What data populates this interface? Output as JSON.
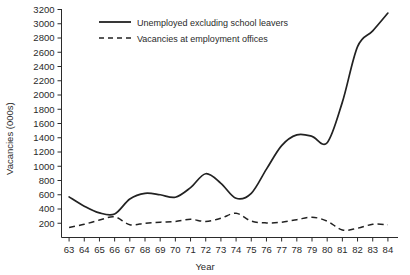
{
  "chart_data": {
    "type": "line",
    "title": "",
    "xlabel": "Year",
    "ylabel": "Vacancies (000s)",
    "xlim": [
      62.5,
      84.5
    ],
    "ylim": [
      0,
      3200
    ],
    "grid": false,
    "legend_position": "top-left",
    "x_tick_labels": [
      "63",
      "64",
      "65",
      "66",
      "67",
      "68",
      "69",
      "70",
      "71",
      "72",
      "73",
      "74",
      "75",
      "76",
      "77",
      "78",
      "79",
      "80",
      "81",
      "82",
      "83",
      "84"
    ],
    "y_tick_labels": [
      "200",
      "400",
      "600",
      "800",
      "1000",
      "1200",
      "1400",
      "1600",
      "1800",
      "2000",
      "2200",
      "2400",
      "2600",
      "2800",
      "3000",
      "3200"
    ],
    "y_ticks": [
      200,
      400,
      600,
      800,
      1000,
      1200,
      1400,
      1600,
      1800,
      2000,
      2200,
      2400,
      2600,
      2800,
      3000,
      3200
    ],
    "x": [
      63,
      64,
      65,
      66,
      67,
      68,
      69,
      70,
      71,
      72,
      73,
      74,
      75,
      76,
      77,
      78,
      79,
      80,
      81,
      82,
      83,
      84
    ],
    "series": [
      {
        "name": "Unemployed excluding school leavers",
        "style": "solid",
        "color": "#222222",
        "values": [
          570,
          440,
          345,
          330,
          540,
          620,
          600,
          565,
          700,
          895,
          760,
          550,
          620,
          960,
          1290,
          1440,
          1420,
          1330,
          1900,
          2680,
          2900,
          3150
        ]
      },
      {
        "name": "Vacancies at employment offices",
        "style": "dashed",
        "color": "#222222",
        "values": [
          140,
          185,
          245,
          290,
          180,
          200,
          215,
          225,
          255,
          225,
          270,
          340,
          230,
          205,
          215,
          250,
          285,
          230,
          105,
          130,
          185,
          180
        ]
      }
    ]
  },
  "legend": {
    "items": [
      {
        "label": "Unemployed excluding school leavers",
        "style": "solid"
      },
      {
        "label": "Vacancies at employment offices",
        "style": "dashed"
      }
    ]
  },
  "axes": {
    "y_title": "Vacancies (000s)",
    "x_title": "Year"
  }
}
